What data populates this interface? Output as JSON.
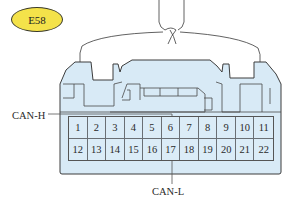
{
  "connector": {
    "id": "E58",
    "badge_color": "#f4e24a",
    "body_color": "#d8eaf6",
    "outline_color": "#3c3c3c",
    "pins_row1": [
      "1",
      "2",
      "3",
      "4",
      "5",
      "6",
      "7",
      "8",
      "9",
      "10",
      "11"
    ],
    "pins_row2": [
      "12",
      "13",
      "14",
      "15",
      "16",
      "17",
      "18",
      "19",
      "20",
      "21",
      "22"
    ]
  },
  "callouts": {
    "can_h": {
      "label": "CAN-H",
      "pin": "6"
    },
    "can_l": {
      "label": "CAN-L",
      "pin": "17"
    }
  }
}
